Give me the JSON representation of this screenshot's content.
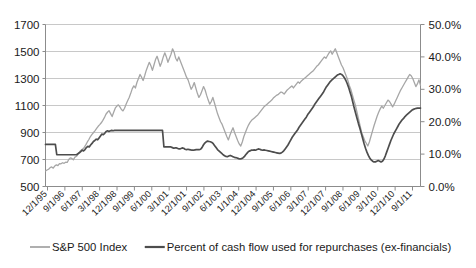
{
  "chart_data": {
    "type": "line",
    "title": "",
    "subtitle": "",
    "xlabel": "",
    "ylabel": "",
    "y2label": "",
    "grid": true,
    "legend_position": "bottom",
    "ylim": [
      500,
      1700
    ],
    "y2lim": [
      0,
      50
    ],
    "yticks": [
      "500",
      "700",
      "900",
      "1100",
      "1300",
      "1500",
      "1700"
    ],
    "ytick_values": [
      500,
      700,
      900,
      1100,
      1300,
      1500,
      1700
    ],
    "y2ticks": [
      "0.0%",
      "10.0%",
      "20.0%",
      "30.0%",
      "40.0%",
      "50.0%"
    ],
    "y2tick_values": [
      0,
      10,
      20,
      30,
      40,
      50
    ],
    "xticks": [
      "12/1/95",
      "9/1/96",
      "6/1/97",
      "3/1/98",
      "12/1/98",
      "9/1/99",
      "6/1/00",
      "3/1/01",
      "12/1/01",
      "9/1/02",
      "6/1/03",
      "1/1/04",
      "12/1/04",
      "9/1/05",
      "6/1/06",
      "3/1/07",
      "12/1/07",
      "9/1/08",
      "6/1/09",
      "3/1/10",
      "12/1/10",
      "9/1/11"
    ],
    "series": [
      {
        "name": "S&P 500 Index",
        "axis": "left",
        "color": "#a6a6a6",
        "values": [
          615,
          622,
          628,
          640,
          645,
          636,
          652,
          660,
          655,
          670,
          668,
          676,
          672,
          680,
          678,
          700,
          712,
          708,
          698,
          718,
          724,
          740,
          757,
          768,
          778,
          790,
          808,
          830,
          848,
          870,
          886,
          900,
          914,
          930,
          946,
          958,
          972,
          990,
          1010,
          1035,
          1050,
          1062,
          1040,
          1018,
          1050,
          1080,
          1095,
          1105,
          1090,
          1070,
          1060,
          1080,
          1110,
          1135,
          1160,
          1190,
          1225,
          1245,
          1230,
          1270,
          1300,
          1330,
          1310,
          1285,
          1320,
          1360,
          1390,
          1420,
          1395,
          1360,
          1400,
          1440,
          1465,
          1430,
          1390,
          1420,
          1460,
          1490,
          1460,
          1420,
          1450,
          1480,
          1520,
          1495,
          1450,
          1430,
          1460,
          1430,
          1400,
          1370,
          1340,
          1310,
          1290,
          1255,
          1220,
          1240,
          1270,
          1230,
          1190,
          1160,
          1180,
          1210,
          1240,
          1215,
          1175,
          1140,
          1110,
          1130,
          1160,
          1120,
          1080,
          1040,
          1010,
          980,
          960,
          930,
          900,
          870,
          845,
          880,
          910,
          935,
          900,
          870,
          840,
          815,
          800,
          830,
          870,
          900,
          930,
          955,
          975,
          990,
          1000,
          1010,
          1020,
          1030,
          1045,
          1060,
          1075,
          1090,
          1100,
          1110,
          1120,
          1130,
          1140,
          1155,
          1165,
          1175,
          1180,
          1190,
          1200,
          1195,
          1185,
          1200,
          1215,
          1225,
          1235,
          1245,
          1230,
          1245,
          1260,
          1275,
          1265,
          1280,
          1290,
          1300,
          1310,
          1320,
          1330,
          1340,
          1350,
          1360,
          1375,
          1390,
          1400,
          1415,
          1430,
          1445,
          1460,
          1450,
          1470,
          1490,
          1505,
          1480,
          1500,
          1520,
          1490,
          1460,
          1430,
          1400,
          1380,
          1350,
          1320,
          1290,
          1250,
          1220,
          1180,
          1140,
          1100,
          1050,
          1000,
          950,
          900,
          870,
          840,
          820,
          800,
          830,
          870,
          910,
          950,
          985,
          1020,
          1050,
          1075,
          1095,
          1080,
          1100,
          1120,
          1140,
          1130,
          1110,
          1090,
          1110,
          1135,
          1160,
          1185,
          1210,
          1230,
          1250,
          1270,
          1290,
          1310,
          1330,
          1320,
          1300,
          1270,
          1240,
          1260,
          1290,
          1250
        ]
      },
      {
        "name": "Percent of cash flow used for repurchases (ex-financials)",
        "axis": "right",
        "color": "#4d4d4d",
        "values": [
          13.0,
          13.0,
          13.0,
          13.0,
          13.0,
          13.0,
          13.0,
          13.0,
          9.8,
          9.8,
          9.8,
          9.8,
          9.8,
          9.8,
          9.8,
          9.8,
          9.8,
          9.8,
          9.8,
          9.8,
          9.8,
          9.8,
          9.8,
          10.1,
          10.4,
          10.8,
          11.2,
          11.0,
          11.4,
          12.0,
          12.4,
          12.2,
          12.8,
          13.3,
          13.9,
          14.2,
          14.6,
          14.4,
          15.0,
          15.6,
          16.2,
          16.0,
          16.4,
          17.0,
          17.2,
          17.0,
          17.2,
          17.3,
          17.2,
          17.3,
          17.3,
          17.3,
          17.3,
          17.3,
          17.3,
          17.3,
          17.3,
          17.3,
          17.3,
          17.3,
          17.3,
          17.3,
          17.3,
          17.3,
          17.3,
          17.3,
          17.3,
          17.3,
          17.3,
          17.3,
          17.3,
          17.3,
          17.3,
          17.3,
          17.3,
          17.3,
          17.3,
          17.3,
          17.3,
          17.3,
          17.3,
          17.3,
          17.3,
          17.3,
          12.2,
          12.2,
          12.2,
          12.2,
          12.2,
          12.2,
          12.0,
          11.8,
          11.9,
          11.9,
          11.7,
          11.6,
          11.7,
          11.9,
          11.8,
          11.5,
          11.4,
          11.5,
          11.4,
          11.3,
          11.2,
          11.2,
          11.3,
          11.4,
          11.4,
          11.4,
          11.5,
          12.0,
          12.8,
          13.4,
          13.8,
          14.0,
          13.9,
          13.8,
          13.6,
          13.2,
          12.6,
          12.0,
          11.4,
          11.0,
          10.6,
          10.2,
          9.8,
          9.5,
          9.3,
          9.2,
          9.4,
          9.6,
          9.4,
          9.2,
          9.0,
          8.9,
          8.8,
          8.6,
          8.5,
          8.6,
          8.8,
          9.2,
          9.8,
          10.3,
          10.8,
          11.0,
          11.2,
          11.2,
          11.3,
          11.2,
          11.4,
          11.6,
          11.5,
          11.3,
          11.2,
          11.3,
          11.2,
          11.1,
          11.0,
          10.9,
          10.8,
          10.7,
          10.6,
          10.5,
          10.4,
          10.3,
          10.2,
          10.3,
          10.6,
          11.0,
          11.6,
          12.2,
          12.8,
          13.6,
          14.4,
          15.2,
          15.8,
          16.4,
          17.0,
          17.6,
          18.4,
          19.0,
          19.6,
          20.2,
          20.8,
          21.4,
          22.2,
          22.8,
          23.4,
          24.0,
          24.6,
          25.4,
          26.0,
          26.6,
          27.2,
          27.8,
          28.4,
          29.0,
          29.8,
          30.6,
          31.2,
          31.8,
          32.4,
          32.8,
          33.2,
          33.6,
          34.0,
          34.4,
          34.6,
          34.8,
          34.6,
          34.2,
          33.6,
          32.8,
          31.8,
          30.6,
          29.2,
          27.8,
          26.0,
          24.2,
          22.6,
          21.0,
          19.4,
          18.0,
          16.4,
          14.8,
          13.2,
          11.8,
          10.6,
          9.6,
          8.8,
          8.2,
          7.8,
          7.6,
          7.6,
          7.8,
          8.0,
          7.8,
          7.6,
          7.8,
          8.4,
          9.4,
          10.6,
          11.8,
          13.0,
          14.2,
          15.2,
          16.2,
          17.0,
          17.8,
          18.6,
          19.4,
          20.0,
          20.6,
          21.0,
          21.6,
          22.0,
          22.4,
          22.8,
          23.2,
          23.6,
          23.8,
          24.0,
          24.1,
          24.2,
          24.2,
          24.2
        ]
      }
    ],
    "legend": [
      {
        "label": "S&P 500 Index",
        "color": "#a6a6a6"
      },
      {
        "label": "Percent of cash flow used for repurchases (ex-financials)",
        "color": "#4d4d4d"
      }
    ]
  },
  "style": {
    "background": "#ffffff",
    "grid_color": "#c8c8c8",
    "axis_color": "#8c8c8c",
    "text_color": "#1a1a1a"
  }
}
